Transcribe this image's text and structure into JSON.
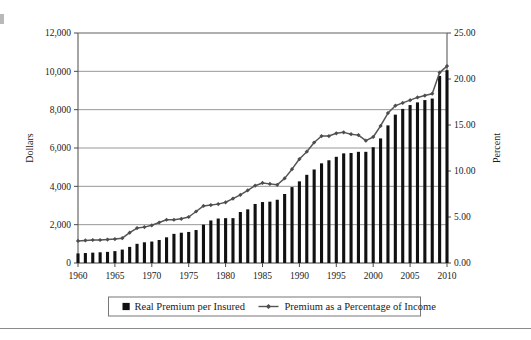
{
  "chart_data": {
    "type": "bar",
    "title": "",
    "subtitle": "",
    "xlabel": "",
    "ylabel": "Dollars",
    "y2label": "Percent",
    "grid": true,
    "legend_position": "bottom",
    "xlim": [
      1960,
      2010
    ],
    "ylim": [
      0,
      12000
    ],
    "y2lim": [
      0,
      25
    ],
    "y_ticks": [
      "0",
      "2,000",
      "4,000",
      "6,000",
      "8,000",
      "10,000",
      "12,000"
    ],
    "y_tick_values": [
      0,
      2000,
      4000,
      6000,
      8000,
      10000,
      12000
    ],
    "y2_ticks": [
      "0.00",
      "5.00",
      "10.00",
      "15.00",
      "20.00",
      "25.00"
    ],
    "y2_tick_values": [
      0,
      5,
      10,
      15,
      20,
      25
    ],
    "x_ticks": [
      "1960",
      "1965",
      "1970",
      "1975",
      "1980",
      "1985",
      "1990",
      "1995",
      "2000",
      "2005",
      "2010"
    ],
    "x_tick_values": [
      1960,
      1965,
      1970,
      1975,
      1980,
      1985,
      1990,
      1995,
      2000,
      2005,
      2010
    ],
    "categories": [
      1960,
      1961,
      1962,
      1963,
      1964,
      1965,
      1966,
      1967,
      1968,
      1969,
      1970,
      1971,
      1972,
      1973,
      1974,
      1975,
      1976,
      1977,
      1978,
      1979,
      1980,
      1981,
      1982,
      1983,
      1984,
      1985,
      1986,
      1987,
      1988,
      1989,
      1990,
      1991,
      1992,
      1993,
      1994,
      1995,
      1996,
      1997,
      1998,
      1999,
      2000,
      2001,
      2002,
      2003,
      2004,
      2005,
      2006,
      2007,
      2008,
      2009,
      2010
    ],
    "series": [
      {
        "name": "Real Premium per Insured",
        "type": "bar",
        "axis": "left",
        "unit": "dollars",
        "color": "#111111",
        "values": [
          500,
          520,
          540,
          560,
          580,
          620,
          700,
          840,
          1000,
          1080,
          1120,
          1200,
          1340,
          1520,
          1580,
          1620,
          1720,
          2000,
          2220,
          2320,
          2340,
          2340,
          2660,
          2800,
          3080,
          3180,
          3200,
          3300,
          3600,
          3960,
          4260,
          4600,
          4880,
          5200,
          5360,
          5540,
          5720,
          5740,
          5800,
          5800,
          6040,
          6500,
          7180,
          7740,
          8040,
          8240,
          8380,
          8500,
          8580,
          9760,
          10060
        ]
      },
      {
        "name": "Premium as a Percentage of Income",
        "type": "line",
        "axis": "right",
        "unit": "percent",
        "color": "#555555",
        "marker": "diamond",
        "values": [
          2.4,
          2.45,
          2.5,
          2.5,
          2.55,
          2.6,
          2.7,
          3.3,
          3.8,
          3.9,
          4.1,
          4.4,
          4.7,
          4.7,
          4.8,
          5.0,
          5.6,
          6.2,
          6.3,
          6.4,
          6.6,
          7.0,
          7.4,
          7.9,
          8.4,
          8.7,
          8.6,
          8.5,
          9.2,
          10.2,
          11.3,
          12.1,
          13.1,
          13.8,
          13.8,
          14.1,
          14.2,
          14.0,
          13.9,
          13.3,
          13.7,
          14.9,
          16.3,
          17.1,
          17.4,
          17.7,
          18.0,
          18.2,
          18.4,
          20.7,
          21.4
        ]
      }
    ],
    "legend": [
      {
        "label": "Real Premium per Insured",
        "marker": "square",
        "color": "#111111"
      },
      {
        "label": "Premium as a Percentage of Income",
        "marker": "line-diamond",
        "color": "#555555"
      }
    ]
  }
}
